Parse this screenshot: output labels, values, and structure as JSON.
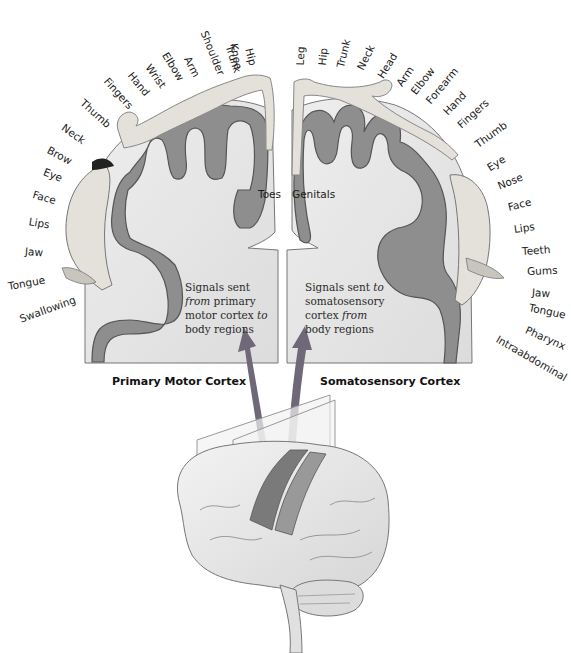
{
  "figure": {
    "motor": {
      "title": "Primary Motor Cortex",
      "caption": {
        "line1": "Signals sent",
        "line2_em": "from",
        "line2_rest": " primary",
        "line3_rest": "motor cortex ",
        "line3_em": "to",
        "line4": "body regions"
      },
      "inner_label": "Toes",
      "labels": [
        "Knee",
        "Hip",
        "Trunk",
        "Shoulder",
        "Arm",
        "Elbow",
        "Wrist",
        "Hand",
        "Fingers",
        "Thumb",
        "Neck",
        "Brow",
        "Eye",
        "Face",
        "Lips",
        "Jaw",
        "Tongue",
        "Swallowing"
      ]
    },
    "sensory": {
      "title": "Somatosensory Cortex",
      "caption": {
        "line1_rest": "Signals sent ",
        "line1_em": "to",
        "line2": "somatosensory",
        "line3_rest": "cortex ",
        "line3_em": "from",
        "line4": "body regions"
      },
      "inner_label": "Genitals",
      "labels": [
        "Leg",
        "Hip",
        "Trunk",
        "Neck",
        "Head",
        "Arm",
        "Elbow",
        "Forearm",
        "Hand",
        "Fingers",
        "Thumb",
        "Eye",
        "Nose",
        "Face",
        "Lips",
        "Teeth",
        "Gums",
        "Jaw",
        "Tongue",
        "Pharynx",
        "Intraabdominal"
      ]
    },
    "colors": {
      "cortex_fill": "#8e8e8e",
      "cortex_stroke": "#555555",
      "panel_fill": "#e6e6e6",
      "arrow": "#6e6878",
      "homunculus": "#e4e0da"
    }
  }
}
